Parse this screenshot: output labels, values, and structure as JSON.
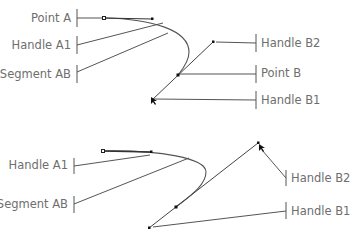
{
  "diagrams": [
    {
      "name": "top",
      "labels": {
        "point_a": "Point A",
        "handle_a1": "Handle A1",
        "segment_ab": "Segment AB",
        "handle_b2": "Handle B2",
        "point_b": "Point B",
        "handle_b1": "Handle B1"
      }
    },
    {
      "name": "bottom",
      "labels": {
        "handle_a1": "Handle A1",
        "segment_ab": "Segment AB",
        "handle_b2": "Handle B2",
        "handle_b1": "Handle B1"
      }
    }
  ],
  "colors": {
    "line": "#555555",
    "label": "#6e6e6e",
    "point": "#111111"
  }
}
